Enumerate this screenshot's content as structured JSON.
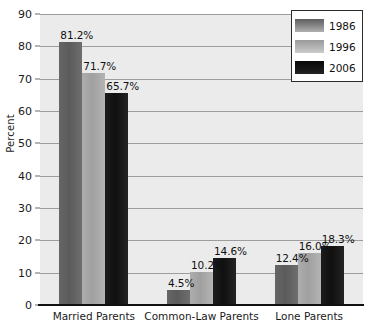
{
  "chart_data": {
    "type": "bar",
    "title": "",
    "xlabel": "",
    "ylabel": "Percent",
    "ylim": [
      0,
      90
    ],
    "ytick_step": 10,
    "yticks": [
      "90",
      "80",
      "70",
      "60",
      "50",
      "40",
      "30",
      "20",
      "10",
      "0"
    ],
    "grid": "horizontal",
    "legend_position": "top-right",
    "categories": [
      "Married Parents",
      "Common-Law Parents",
      "Lone Parents"
    ],
    "series": [
      {
        "name": "1986",
        "color": "#5b5b5b",
        "values": [
          81.2,
          71.7,
          12.4
        ],
        "labels": [
          "81.2%",
          "",
          "12.4%"
        ]
      },
      {
        "name": "1996",
        "color": "#a0a0a0",
        "values": [
          71.7,
          10.2,
          16.0
        ],
        "labels": [
          "71.7%",
          "10.2%",
          "16.0%"
        ]
      },
      {
        "name": "2006",
        "color": "#101010",
        "values": [
          65.7,
          14.6,
          18.3
        ],
        "labels": [
          "65.7%",
          "14.6%",
          "18.3%"
        ]
      }
    ],
    "groups": [
      {
        "category": "Married Parents",
        "bars": [
          {
            "series": "1986",
            "value": 81.2,
            "label": "81.2%"
          },
          {
            "series": "1996",
            "value": 71.7,
            "label": "71.7%"
          },
          {
            "series": "2006",
            "value": 65.7,
            "label": "65.7%"
          }
        ]
      },
      {
        "category": "Common-Law Parents",
        "bars": [
          {
            "series": "1986",
            "value": 4.5,
            "label": "4.5%"
          },
          {
            "series": "1996",
            "value": 10.2,
            "label": "10.2%"
          },
          {
            "series": "2006",
            "value": 14.6,
            "label": "14.6%"
          }
        ]
      },
      {
        "category": "Lone Parents",
        "bars": [
          {
            "series": "1986",
            "value": 12.4,
            "label": "12.4%"
          },
          {
            "series": "1996",
            "value": 16.0,
            "label": "16.0%"
          },
          {
            "series": "2006",
            "value": 18.3,
            "label": "18.3%"
          }
        ]
      }
    ],
    "colors": {
      "plot_background": "#ebebeb",
      "gridline": "#9d9d9d",
      "axis": "#111111",
      "text": "#1a1a1a"
    }
  },
  "legend": {
    "items": [
      {
        "label": "1986",
        "swatch": "y1986"
      },
      {
        "label": "1996",
        "swatch": "y1996"
      },
      {
        "label": "2006",
        "swatch": "y2006"
      }
    ]
  },
  "axis": {
    "y_title": "Percent"
  }
}
